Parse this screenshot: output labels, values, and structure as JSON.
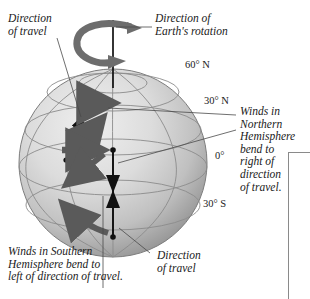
{
  "figure": {
    "background_color": "#ffffff",
    "globe": {
      "fill_light": "#e4e4e4",
      "fill_mid": "#c8c8c8",
      "fill_dark": "#8f8f8f",
      "grid_color": "#8b8b8b"
    },
    "arrow_colors": {
      "intended_path": "#111111",
      "deflected_path": "#5a5a5a",
      "rotation": "#6d6d6d"
    }
  },
  "labels": {
    "direction_of_travel_top": "Direction\nof travel",
    "direction_of_earths_rotation": "Direction of\nEarth's rotation",
    "winds_northern": "Winds in\nNorthern\nHemisphere\nbend to\nright of\ndirection\nof travel.",
    "winds_southern": "Winds in Southern\nHemisphere bend to\nleft of direction of travel.",
    "direction_of_travel_bottom": "Direction\nof travel"
  },
  "latitudes": [
    {
      "name": "sixty-north",
      "text": "60° N"
    },
    {
      "name": "thirty-north",
      "text": "30° N"
    },
    {
      "name": "equator",
      "text": "0°"
    },
    {
      "name": "thirty-south",
      "text": "30° S"
    }
  ]
}
